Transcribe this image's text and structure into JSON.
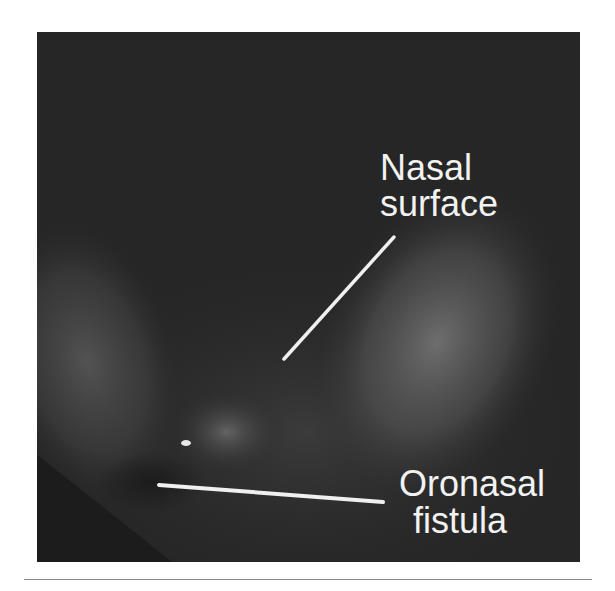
{
  "figure": {
    "labels": {
      "nasal_line1": "Nasal",
      "nasal_line2": "surface",
      "fistula_line1": "Oronasal",
      "fistula_line2": "fistula"
    },
    "colors": {
      "background": "#ffffff",
      "photo_base": "#262626",
      "label_text": "#f2f2f2",
      "leader_line": "#f0f0f0",
      "rule": "#8a8a8a"
    }
  }
}
